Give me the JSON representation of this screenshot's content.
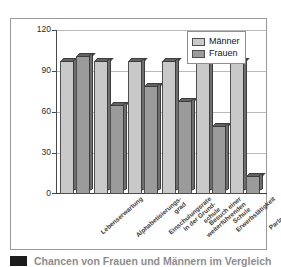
{
  "chart_data": {
    "type": "bar",
    "title": "",
    "xlabel": "",
    "ylabel": "",
    "ylim": [
      0,
      120
    ],
    "yticks": [
      0,
      30,
      60,
      90,
      120
    ],
    "grid": true,
    "legend_position": "top-right",
    "categories": [
      "Lebenserwartung",
      "Alphabetisierungs-grad",
      "Einschulungsrate in der Grund-schule",
      "Besuch einer weiterführenden Schule",
      "Erwerbstätigkeit",
      "Parlamentarier/-innen"
    ],
    "category_lines": [
      [
        "Lebenserwartung"
      ],
      [
        "Alphabetisierungs-",
        "grad"
      ],
      [
        "Einschulungsrate",
        "in der Grund-",
        "schule"
      ],
      [
        "Besuch einer",
        "weiterführenden",
        "Schule"
      ],
      [
        "Erwerbstätigkeit"
      ],
      [
        "Parlamentarier/",
        "-innen"
      ]
    ],
    "series": [
      {
        "name": "Männer",
        "color": "#c9c9c9",
        "values": [
          97,
          97,
          97,
          97,
          97,
          97
        ]
      },
      {
        "name": "Frauen",
        "color": "#9b9b9b",
        "values": [
          101,
          65,
          79,
          68,
          50,
          13
        ]
      }
    ]
  },
  "legend": {
    "items": [
      {
        "label": "Männer"
      },
      {
        "label": "Frauen"
      }
    ]
  },
  "axis": {
    "y_tick_labels": [
      "120",
      "90",
      "60",
      "30",
      "0"
    ]
  },
  "caption": {
    "text": "Chancen von Frauen und Männern im Vergleich"
  },
  "colors": {
    "men_bar": "#c9c9c9",
    "women_bar": "#9b9b9b",
    "bar_outline": "#4f4f4f",
    "gridline": "#b9b9b9",
    "frame": "#9a9a9a"
  }
}
